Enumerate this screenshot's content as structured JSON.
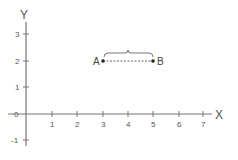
{
  "diagram": {
    "type": "coordinate-plane",
    "axes": {
      "x_label": "X",
      "y_label": "Y",
      "x_ticks": [
        "1",
        "2",
        "3",
        "4",
        "5",
        "6",
        "7"
      ],
      "y_ticks": [
        "3",
        "2",
        "1",
        "0",
        "-1"
      ],
      "origin_label": "0"
    },
    "points": [
      {
        "label": "A",
        "x": 3,
        "y": 2
      },
      {
        "label": "B",
        "x": 5,
        "y": 2
      }
    ],
    "segment": {
      "from": "A",
      "to": "B",
      "style": "dashed"
    },
    "brace": {
      "over": "AB",
      "position": "above"
    },
    "colors": {
      "axis": "#777777",
      "text": "#555555",
      "points": "#222222",
      "background": "#ffffff"
    }
  }
}
